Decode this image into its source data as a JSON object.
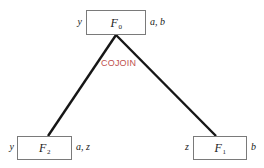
{
  "diagram": {
    "type": "cojoin-tree",
    "edge_label": "COJOIN",
    "edge_label_color": "#c0504d",
    "edge_color": "#161616",
    "node_border_color": "#7a7a7a",
    "background": "#ffffff",
    "nodes": {
      "root": {
        "name": "F",
        "subscript": "0",
        "left_annotation": "y",
        "right_annotation": "a, b"
      },
      "child_left": {
        "name": "F",
        "subscript": "2",
        "left_annotation": "y",
        "right_annotation": "a, z"
      },
      "child_right": {
        "name": "F",
        "subscript": "1",
        "left_annotation": "z",
        "right_annotation": "b"
      }
    },
    "edges": [
      {
        "from": "root",
        "to": "child_left"
      },
      {
        "from": "root",
        "to": "child_right"
      }
    ]
  }
}
